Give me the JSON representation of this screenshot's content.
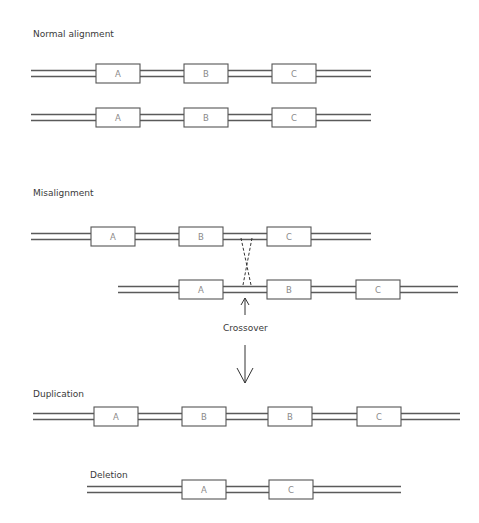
{
  "sections": {
    "normal": {
      "title": "Normal alignment"
    },
    "misalignment": {
      "title": "Misalignment",
      "crossover_label": "Crossover"
    },
    "duplication": {
      "title": "Duplication"
    },
    "deletion": {
      "title": "Deletion"
    }
  },
  "rows": [
    {
      "id": "normal-1",
      "x1": 31,
      "x2": 371,
      "ytop": 64,
      "genes": [
        {
          "label": "A",
          "x": 96
        },
        {
          "label": "B",
          "x": 184
        },
        {
          "label": "C",
          "x": 272
        }
      ]
    },
    {
      "id": "normal-2",
      "x1": 31,
      "x2": 371,
      "ytop": 108,
      "genes": [
        {
          "label": "A",
          "x": 96
        },
        {
          "label": "B",
          "x": 184
        },
        {
          "label": "C",
          "x": 272
        }
      ]
    },
    {
      "id": "misaligned-1",
      "x1": 31,
      "x2": 371,
      "ytop": 227,
      "genes": [
        {
          "label": "A",
          "x": 91
        },
        {
          "label": "B",
          "x": 179
        },
        {
          "label": "C",
          "x": 267
        }
      ]
    },
    {
      "id": "misaligned-2",
      "x1": 118,
      "x2": 458,
      "ytop": 280,
      "genes": [
        {
          "label": "A",
          "x": 179
        },
        {
          "label": "B",
          "x": 267
        },
        {
          "label": "C",
          "x": 356
        }
      ]
    },
    {
      "id": "duplication",
      "x1": 33,
      "x2": 460,
      "ytop": 407,
      "genes": [
        {
          "label": "A",
          "x": 94
        },
        {
          "label": "B",
          "x": 182
        },
        {
          "label": "B",
          "x": 268
        },
        {
          "label": "C",
          "x": 357
        }
      ]
    },
    {
      "id": "deletion",
      "x1": 87,
      "x2": 401,
      "ytop": 480,
      "genes": [
        {
          "label": "A",
          "x": 182
        },
        {
          "label": "C",
          "x": 269
        }
      ]
    }
  ],
  "gene_box": {
    "width": 44,
    "height": 19
  },
  "colors": {
    "strand": "#5a5a5a",
    "box_border": "#555555",
    "gene_text": "#8a8a8a",
    "label_text": "#3a3a3a"
  }
}
